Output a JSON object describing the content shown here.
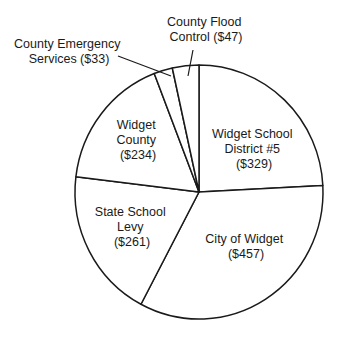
{
  "chart_data": {
    "type": "pie",
    "title": "",
    "categories": [
      "Widget School District #5",
      "City of Widget",
      "State School Levy",
      "Widget County",
      "County Emergency Services",
      "County Flood Control"
    ],
    "values": [
      329,
      457,
      261,
      234,
      33,
      47
    ],
    "units": "$",
    "start_angle": "12 o'clock",
    "direction": "clockwise",
    "legend": "none (direct labels)",
    "colors": {
      "fill": "#ffffff",
      "stroke": "#1a1a1a"
    }
  },
  "labels": {
    "school": [
      "Widget School",
      "District #5",
      "($329)"
    ],
    "city": [
      "City of Widget",
      "($457)"
    ],
    "state": [
      "State School",
      "Levy",
      "($261)"
    ],
    "county": [
      "Widget",
      "County",
      "($234)"
    ],
    "emergency": [
      "County Emergency",
      "Services ($33)"
    ],
    "flood": [
      "County Flood",
      "Control ($47)"
    ]
  }
}
